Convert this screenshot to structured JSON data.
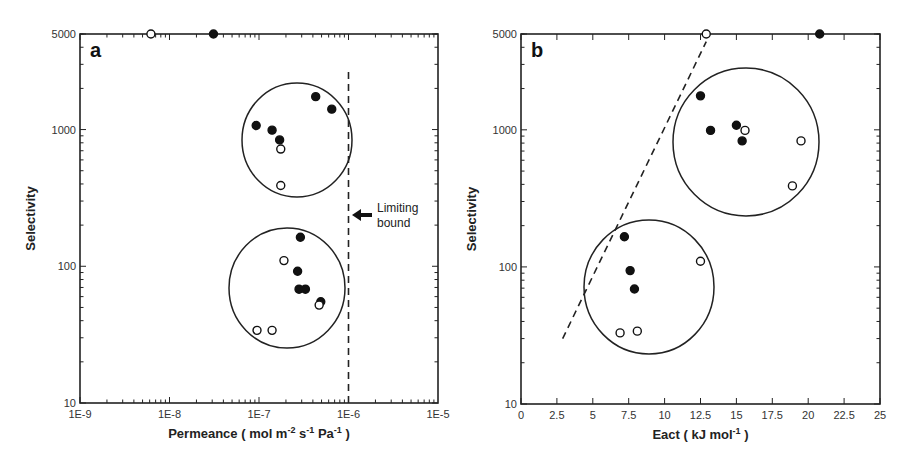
{
  "figure": {
    "panel_a": {
      "letter": "a",
      "xlabel_main": "Permeance ( mol m",
      "xlabel_sup1": "-2",
      "xlabel_mid1": " s",
      "xlabel_sup2": "-1",
      "xlabel_mid2": " Pa",
      "xlabel_sup3": "-1",
      "xlabel_end": " )",
      "ylabel": "Selectivity",
      "annotation": [
        "Limiting",
        "bound"
      ]
    },
    "panel_b": {
      "letter": "b",
      "xlabel_main": "Eact ( kJ mol",
      "xlabel_sup": "-1",
      "xlabel_end": " )",
      "ylabel": "Selectivity"
    },
    "colors": {
      "axis": "#222222",
      "filled": "#111111",
      "open_fill": "#ffffff",
      "circle": "#222222"
    }
  },
  "chart_data": [
    {
      "type": "scatter",
      "title": "a",
      "xlabel": "Permeance ( mol m^-2 s^-1 Pa^-1 )",
      "ylabel": "Selectivity",
      "xscale": "log",
      "yscale": "log",
      "xlim": [
        1e-09,
        1e-05
      ],
      "ylim": [
        10,
        5000
      ],
      "xticks": [
        "1E-9",
        "1E-8",
        "1E-7",
        "1E-6",
        "1E-5"
      ],
      "yticks": [
        "10",
        "100",
        "1000",
        "5000"
      ],
      "grid": false,
      "series": [
        {
          "name": "filled",
          "marker": "filled-circle",
          "points": [
            [
              3.1e-08,
              5000
            ],
            [
              9.3e-08,
              1070
            ],
            [
              1.4e-07,
              990
            ],
            [
              1.7e-07,
              840
            ],
            [
              4.3e-07,
              1740
            ],
            [
              6.5e-07,
              1410
            ],
            [
              2.9e-07,
              163
            ],
            [
              2.7e-07,
              92
            ],
            [
              2.8e-07,
              68
            ],
            [
              3.3e-07,
              68
            ],
            [
              4.9e-07,
              55
            ]
          ]
        },
        {
          "name": "open",
          "marker": "open-circle",
          "points": [
            [
              6.2e-09,
              5000
            ],
            [
              1.75e-07,
              720
            ],
            [
              1.75e-07,
              390
            ],
            [
              1.9e-07,
              110
            ],
            [
              9.5e-08,
              34
            ],
            [
              1.4e-07,
              34
            ],
            [
              4.7e-07,
              52
            ]
          ]
        }
      ],
      "annotations": [
        {
          "type": "vline-dashed",
          "x": 1e-06,
          "y_from": 10,
          "y_to": 2700,
          "label": "Limiting bound",
          "arrow": "left"
        },
        {
          "type": "ellipse",
          "center": [
            2.5e-07,
            850
          ],
          "note": "upper cluster circle"
        },
        {
          "type": "ellipse",
          "center": [
            2e-07,
            70
          ],
          "note": "lower cluster circle"
        }
      ]
    },
    {
      "type": "scatter",
      "title": "b",
      "xlabel": "Eact ( kJ mol^-1 )",
      "ylabel": "Selectivity",
      "xscale": "linear",
      "yscale": "log",
      "xlim": [
        0,
        25
      ],
      "ylim": [
        10,
        5000
      ],
      "xticks": [
        "0",
        "2.5",
        "5",
        "7.5",
        "10",
        "12.5",
        "15",
        "17.5",
        "20",
        "22.5",
        "25"
      ],
      "yticks": [
        "10",
        "100",
        "1000",
        "5000"
      ],
      "grid": false,
      "series": [
        {
          "name": "filled",
          "marker": "filled-circle",
          "points": [
            [
              20.8,
              5000
            ],
            [
              12.5,
              1770
            ],
            [
              13.2,
              990
            ],
            [
              15.0,
              1080
            ],
            [
              15.4,
              830
            ],
            [
              7.2,
              166
            ],
            [
              7.6,
              94
            ],
            [
              7.9,
              69
            ]
          ]
        },
        {
          "name": "open",
          "marker": "open-circle",
          "points": [
            [
              12.9,
              5000
            ],
            [
              15.6,
              990
            ],
            [
              19.5,
              830
            ],
            [
              18.9,
              390
            ],
            [
              6.9,
              33
            ],
            [
              8.1,
              34
            ],
            [
              12.5,
              110
            ]
          ]
        }
      ],
      "annotations": [
        {
          "type": "line-dashed",
          "from": [
            2.9,
            30
          ],
          "to": [
            12.9,
            4400
          ]
        },
        {
          "type": "ellipse",
          "center": [
            15.7,
            830
          ],
          "note": "upper cluster circle"
        },
        {
          "type": "ellipse",
          "center": [
            9.0,
            72
          ],
          "note": "lower cluster circle"
        }
      ]
    }
  ]
}
